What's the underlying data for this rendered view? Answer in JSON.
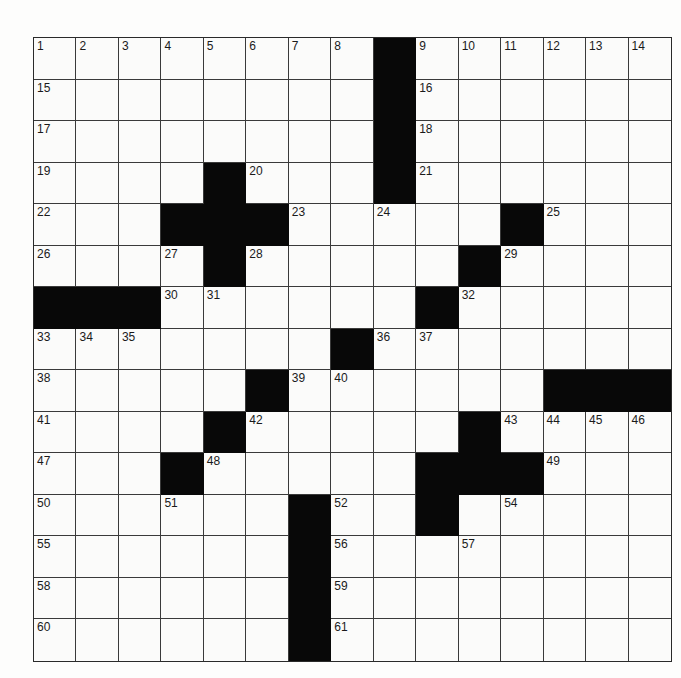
{
  "puzzle": {
    "rows": 15,
    "cols": 15,
    "grid": [
      "........#......",
      "........#......",
      "........#......",
      "....#...#......",
      "...###.....#...",
      "....#.....#....",
      "###......#.....",
      ".......#.......",
      ".....#......###",
      "....#.....#....",
      "...#.....###...",
      "......#..#.....",
      "......#........",
      "......#........",
      "......#........"
    ],
    "numbers": [
      {
        "r": 0,
        "c": 0,
        "n": "1"
      },
      {
        "r": 0,
        "c": 1,
        "n": "2"
      },
      {
        "r": 0,
        "c": 2,
        "n": "3"
      },
      {
        "r": 0,
        "c": 3,
        "n": "4"
      },
      {
        "r": 0,
        "c": 4,
        "n": "5"
      },
      {
        "r": 0,
        "c": 5,
        "n": "6"
      },
      {
        "r": 0,
        "c": 6,
        "n": "7"
      },
      {
        "r": 0,
        "c": 7,
        "n": "8"
      },
      {
        "r": 0,
        "c": 9,
        "n": "9"
      },
      {
        "r": 0,
        "c": 10,
        "n": "10"
      },
      {
        "r": 0,
        "c": 11,
        "n": "11"
      },
      {
        "r": 0,
        "c": 12,
        "n": "12"
      },
      {
        "r": 0,
        "c": 13,
        "n": "13"
      },
      {
        "r": 0,
        "c": 14,
        "n": "14"
      },
      {
        "r": 1,
        "c": 0,
        "n": "15"
      },
      {
        "r": 1,
        "c": 9,
        "n": "16"
      },
      {
        "r": 2,
        "c": 0,
        "n": "17"
      },
      {
        "r": 2,
        "c": 9,
        "n": "18"
      },
      {
        "r": 3,
        "c": 0,
        "n": "19"
      },
      {
        "r": 3,
        "c": 5,
        "n": "20"
      },
      {
        "r": 3,
        "c": 9,
        "n": "21"
      },
      {
        "r": 4,
        "c": 0,
        "n": "22"
      },
      {
        "r": 4,
        "c": 6,
        "n": "23"
      },
      {
        "r": 4,
        "c": 8,
        "n": "24"
      },
      {
        "r": 4,
        "c": 12,
        "n": "25"
      },
      {
        "r": 5,
        "c": 0,
        "n": "26"
      },
      {
        "r": 5,
        "c": 3,
        "n": "27"
      },
      {
        "r": 5,
        "c": 5,
        "n": "28"
      },
      {
        "r": 5,
        "c": 11,
        "n": "29"
      },
      {
        "r": 6,
        "c": 3,
        "n": "30"
      },
      {
        "r": 6,
        "c": 4,
        "n": "31"
      },
      {
        "r": 6,
        "c": 10,
        "n": "32"
      },
      {
        "r": 7,
        "c": 0,
        "n": "33"
      },
      {
        "r": 7,
        "c": 1,
        "n": "34"
      },
      {
        "r": 7,
        "c": 2,
        "n": "35"
      },
      {
        "r": 7,
        "c": 8,
        "n": "36"
      },
      {
        "r": 7,
        "c": 9,
        "n": "37"
      },
      {
        "r": 8,
        "c": 0,
        "n": "38"
      },
      {
        "r": 8,
        "c": 6,
        "n": "39"
      },
      {
        "r": 8,
        "c": 7,
        "n": "40"
      },
      {
        "r": 9,
        "c": 0,
        "n": "41"
      },
      {
        "r": 9,
        "c": 5,
        "n": "42"
      },
      {
        "r": 9,
        "c": 11,
        "n": "43"
      },
      {
        "r": 9,
        "c": 12,
        "n": "44"
      },
      {
        "r": 9,
        "c": 13,
        "n": "45"
      },
      {
        "r": 9,
        "c": 14,
        "n": "46"
      },
      {
        "r": 10,
        "c": 0,
        "n": "47"
      },
      {
        "r": 10,
        "c": 4,
        "n": "48"
      },
      {
        "r": 10,
        "c": 12,
        "n": "49"
      },
      {
        "r": 11,
        "c": 0,
        "n": "50"
      },
      {
        "r": 11,
        "c": 3,
        "n": "51"
      },
      {
        "r": 11,
        "c": 7,
        "n": "52"
      },
      {
        "r": 11,
        "c": 9,
        "n": "53"
      },
      {
        "r": 11,
        "c": 11,
        "n": "54"
      },
      {
        "r": 12,
        "c": 0,
        "n": "55"
      },
      {
        "r": 12,
        "c": 7,
        "n": "56"
      },
      {
        "r": 12,
        "c": 10,
        "n": "57"
      },
      {
        "r": 13,
        "c": 0,
        "n": "58"
      },
      {
        "r": 13,
        "c": 7,
        "n": "59"
      },
      {
        "r": 14,
        "c": 0,
        "n": "60"
      },
      {
        "r": 14,
        "c": 7,
        "n": "61"
      }
    ],
    "colors": {
      "block": "#080808",
      "cell": "#fbfbfa",
      "line": "#3a3a3a"
    }
  }
}
